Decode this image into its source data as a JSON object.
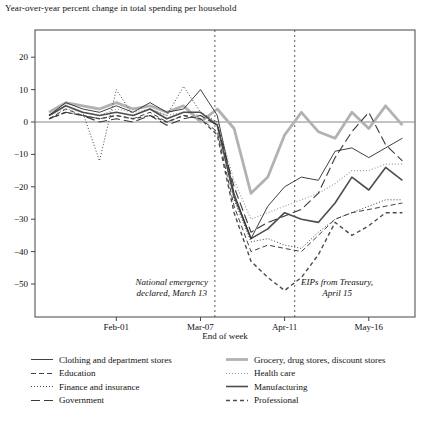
{
  "chart_data": {
    "type": "line",
    "title": "Year-over-year percent change in total spending per household",
    "xlabel": "End of week",
    "ylim": [
      -60,
      27.5
    ],
    "grid": false,
    "legend_position": "bottom, two columns",
    "y_ticks": [
      {
        "value": 20,
        "label": "20"
      },
      {
        "value": 10,
        "label": "10"
      },
      {
        "value": 0,
        "label": "0"
      },
      {
        "value": -10,
        "label": "−10"
      },
      {
        "value": -20,
        "label": "−20"
      },
      {
        "value": -30,
        "label": "−30"
      },
      {
        "value": -40,
        "label": "−40"
      },
      {
        "value": -50,
        "label": "−50"
      }
    ],
    "x_ticks": [
      {
        "index": 4,
        "label": "Feb-01"
      },
      {
        "index": 9,
        "label": "Mar-07"
      },
      {
        "index": 14,
        "label": "Apr-11"
      },
      {
        "index": 19,
        "label": "May-16"
      }
    ],
    "categories": [
      "Jan-04",
      "Jan-11",
      "Jan-18",
      "Jan-25",
      "Feb-01",
      "Feb-08",
      "Feb-15",
      "Feb-22",
      "Feb-29",
      "Mar-07",
      "Mar-14",
      "Mar-21",
      "Mar-28",
      "Apr-04",
      "Apr-11",
      "Apr-18",
      "Apr-25",
      "May-02",
      "May-09",
      "May-16",
      "May-23",
      "May-30"
    ],
    "event_lines": [
      {
        "x_index": 9.857,
        "label_line1": "National emergency",
        "label_line2": "declared, March 13",
        "label_side": "left"
      },
      {
        "x_index": 14.6,
        "label_line1": "EIPs from Treasury,",
        "label_line2": "April 15",
        "label_side": "right"
      }
    ],
    "zero_line": true,
    "series": [
      {
        "name": "Clothing and department stores",
        "color": "#2b2b2b",
        "width": 0.9,
        "dash": "",
        "values": [
          2,
          6,
          4,
          3,
          5,
          3,
          6,
          3,
          4,
          10,
          2,
          -22,
          -36,
          -26,
          -20,
          -17,
          -18,
          -9,
          -8,
          -11,
          -8,
          -5
        ]
      },
      {
        "name": "Education",
        "color": "#2b2b2b",
        "width": 0.9,
        "dash": "5 3",
        "values": [
          1,
          4,
          2,
          1,
          2,
          1,
          3,
          0,
          2,
          1,
          -3,
          -26,
          -40,
          -38,
          -39,
          -40,
          -35,
          -30,
          -28,
          -27,
          -26,
          -25
        ]
      },
      {
        "name": "Finance and insurance",
        "color": "#2b2b2b",
        "width": 0.9,
        "dash": "1 2",
        "values": [
          2,
          5,
          3,
          -12,
          10,
          2,
          4,
          2,
          11,
          3,
          0,
          -24,
          -37,
          -36,
          -38,
          -39,
          -34,
          -30,
          -28,
          -26,
          -24,
          -24
        ]
      },
      {
        "name": "Government",
        "color": "#3a3a3a",
        "width": 1.1,
        "dash": "9 4",
        "values": [
          1,
          3,
          2,
          0,
          1,
          0,
          2,
          -1,
          1,
          2,
          -1,
          -20,
          -34,
          -31,
          -29,
          -27,
          -22,
          -11,
          -3,
          3,
          -7,
          -12
        ]
      },
      {
        "name": "Grocery, drug stores, discount stores",
        "color": "#b2b2b2",
        "width": 2.8,
        "dash": "",
        "values": [
          3,
          6,
          5,
          4,
          6,
          4,
          5,
          3,
          5,
          0,
          4,
          -2,
          -22,
          -17,
          -4,
          3,
          -3,
          -5,
          3,
          -2,
          5,
          -1
        ]
      },
      {
        "name": "Health care",
        "color": "#9b9b9b",
        "width": 1.1,
        "dash": "1 2",
        "values": [
          2,
          4,
          3,
          2,
          4,
          3,
          4,
          2,
          3,
          2,
          0,
          -18,
          -30,
          -28,
          -26,
          -24,
          -22,
          -19,
          -15,
          -15,
          -13,
          -13
        ]
      },
      {
        "name": "Manufacturing",
        "color": "#4d4d4d",
        "width": 1.6,
        "dash": "",
        "values": [
          2,
          5,
          3,
          2,
          3,
          2,
          4,
          1,
          3,
          3,
          -1,
          -23,
          -36,
          -33,
          -28,
          -30,
          -31,
          -25,
          -17,
          -21,
          -14,
          -18
        ]
      },
      {
        "name": "Professional",
        "color": "#4d4d4d",
        "width": 1.4,
        "dash": "4 3",
        "values": [
          1,
          3,
          2,
          1,
          2,
          1,
          2,
          0,
          2,
          1,
          -4,
          -28,
          -43,
          -48,
          -52,
          -48,
          -41,
          -31,
          -35,
          -32,
          -28,
          -28
        ]
      }
    ]
  }
}
